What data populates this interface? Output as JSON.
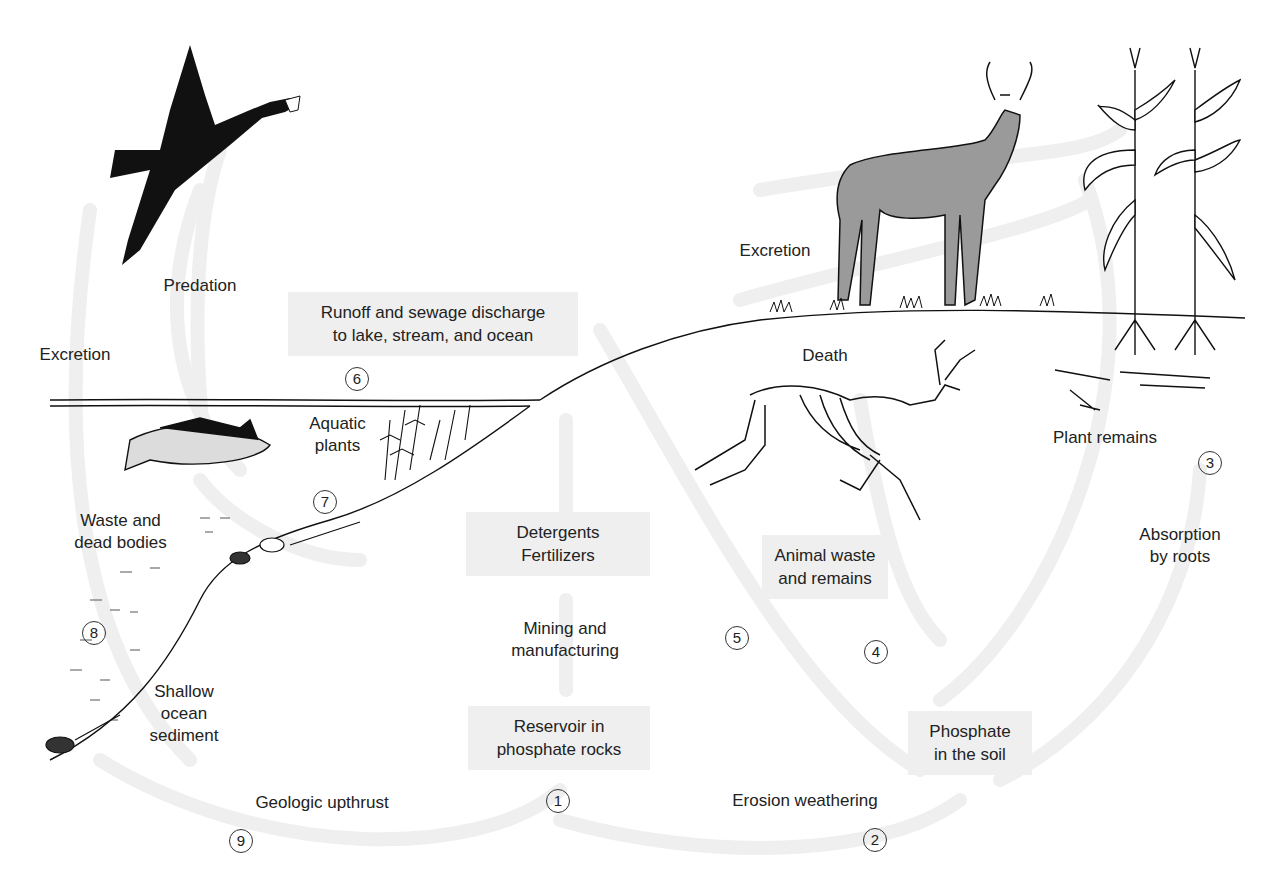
{
  "colors": {
    "box_fill": "#efefef",
    "arrow": "#eeeeee",
    "ink": "#222222"
  },
  "labels": {
    "predation": "Predation",
    "excretion_left": "Excretion",
    "excretion_right": "Excretion",
    "death": "Death",
    "plant_remains": "Plant remains",
    "aquatic_plants": [
      "Aquatic",
      "plants"
    ],
    "waste_dead": [
      "Waste and",
      "dead bodies"
    ],
    "shallow_sediment": [
      "Shallow",
      "ocean",
      "sediment"
    ],
    "mining": [
      "Mining and",
      "manufacturing"
    ],
    "absorption": [
      "Absorption",
      "by roots"
    ],
    "geologic": "Geologic upthrust",
    "erosion": "Erosion weathering"
  },
  "boxes": {
    "runoff": [
      "Runoff and sewage discharge",
      "to lake, stream, and ocean"
    ],
    "detergents": [
      "Detergents",
      "Fertilizers"
    ],
    "reservoir": [
      "Reservoir in",
      "phosphate rocks"
    ],
    "animal_waste": [
      "Animal waste",
      "and remains"
    ],
    "phosphate_soil": [
      "Phosphate",
      "in the soil"
    ]
  },
  "steps": [
    "1",
    "2",
    "3",
    "4",
    "5",
    "6",
    "7",
    "8",
    "9"
  ],
  "illustrations": [
    "bird-with-fish",
    "deer",
    "corn-plants",
    "fish",
    "deer-skeleton",
    "aquatic-plants",
    "plant-remains",
    "fossils"
  ]
}
